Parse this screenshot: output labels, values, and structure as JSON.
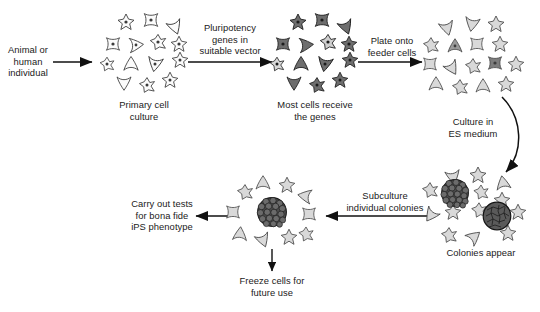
{
  "diagram": {
    "colors": {
      "line": "#111111",
      "text": "#1a1a1a",
      "cell_light_fill": "#d9d9d9",
      "cell_mid_fill": "#b3b3b3",
      "cell_dark_fill": "#6e6e6e",
      "cell_white_fill": "#fbfbfb",
      "colony_dark_fill": "#4d4d4d",
      "colony_cell_fill": "#595959",
      "background": "#ffffff"
    },
    "labels": {
      "source": "Animal or\nhuman\nindividual",
      "primary_culture": "Primary cell\nculture",
      "vector_step": "Pluripotency\ngenes in\nsuitable vector",
      "genes_received": "Most cells receive\nthe genes",
      "plate_step": "Plate onto\nfeeder cells",
      "culture_step": "Culture in\nES medium",
      "colonies_appear": "Colonies appear",
      "subculture_step": "Subculture\nindividual colonies",
      "tests_step": "Carry out tests\nfor bona fide\niPS phenotype",
      "freeze_step": "Freeze cells for\nfuture use"
    },
    "stages": [
      {
        "id": "source",
        "label": "Animal or human individual",
        "kind": "text"
      },
      {
        "id": "primary-cell-culture",
        "label": "Primary cell culture",
        "kind": "cell-cluster",
        "cell_count": 14,
        "cell_shade": "white"
      },
      {
        "id": "transduced-cells",
        "label": "Most cells receive the genes",
        "kind": "cell-cluster",
        "cell_count": 14,
        "cell_shade": "dark"
      },
      {
        "id": "feeder-plated-cells",
        "label": "Culture in ES medium",
        "kind": "cell-cluster",
        "cell_count": 16,
        "cell_shade": "light"
      },
      {
        "id": "colonies",
        "label": "Colonies appear",
        "kind": "cell-cluster-with-colonies",
        "cell_count": 12,
        "colony_count": 2,
        "cell_shade": "light"
      },
      {
        "id": "subcultured-colony",
        "label": "Subculture individual colonies",
        "kind": "single-colony",
        "cell_count": 12,
        "colony_count": 1,
        "cell_shade": "light"
      },
      {
        "id": "phenotype-tests",
        "label": "Carry out tests for bona fide iPS phenotype",
        "kind": "text"
      },
      {
        "id": "freeze",
        "label": "Freeze cells for future use",
        "kind": "text"
      }
    ],
    "arrows": [
      {
        "id": "source-to-primary",
        "direction": "right",
        "label": ""
      },
      {
        "id": "primary-to-transduced",
        "direction": "right",
        "label": "Pluripotency genes in suitable vector"
      },
      {
        "id": "transduced-to-feeder",
        "direction": "right",
        "label": "Plate onto feeder cells"
      },
      {
        "id": "feeder-to-colonies",
        "direction": "curve-down",
        "label": "Culture in ES medium"
      },
      {
        "id": "colonies-to-subculture",
        "direction": "left",
        "label": "Subculture individual colonies"
      },
      {
        "id": "subculture-to-tests",
        "direction": "left",
        "label": "Carry out tests for bona fide iPS phenotype"
      },
      {
        "id": "subculture-to-freeze",
        "direction": "down",
        "label": "Freeze cells for future use"
      }
    ]
  }
}
